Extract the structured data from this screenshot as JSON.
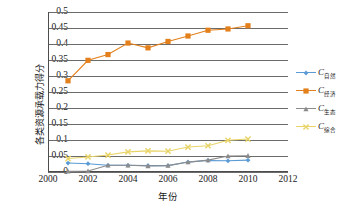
{
  "chart_data": {
    "type": "line",
    "title": "",
    "xlabel": "年份",
    "ylabel": "各类资源承载力得分",
    "xlim": [
      2000,
      2012
    ],
    "ylim": [
      0,
      0.5
    ],
    "grid": "horizontal",
    "legend_position": "right",
    "x": [
      2001,
      2002,
      2003,
      2004,
      2005,
      2006,
      2007,
      2008,
      2009,
      2010
    ],
    "xticks": [
      "2000",
      "2002",
      "2004",
      "2006",
      "2008",
      "2010",
      "2012"
    ],
    "xtick_values": [
      2000,
      2002,
      2004,
      2006,
      2008,
      2010,
      2012
    ],
    "yticks": [
      "0",
      "0.05",
      "0.1",
      "0.15",
      "0.2",
      "0.25",
      "0.3",
      "0.35",
      "0.4",
      "0.45",
      "0.5"
    ],
    "ytick_values": [
      0,
      0.05,
      0.1,
      0.15,
      0.2,
      0.25,
      0.3,
      0.35,
      0.4,
      0.45,
      0.5
    ],
    "series": [
      {
        "name": "C自然",
        "name_base": "C",
        "name_sub": "自然",
        "color": "#5B9BD5",
        "marker": "diamond",
        "values": [
          0.028,
          0.026,
          0.021,
          0.021,
          0.02,
          0.02,
          0.031,
          0.036,
          0.035,
          0.037
        ]
      },
      {
        "name": "C经济",
        "name_base": "C",
        "name_sub": "经济",
        "color": "#E3801B",
        "marker": "square",
        "values": [
          0.285,
          0.349,
          0.367,
          0.403,
          0.388,
          0.408,
          0.425,
          0.443,
          0.447,
          0.457
        ]
      },
      {
        "name": "C生态",
        "name_base": "C",
        "name_sub": "生态",
        "color": "#8C8C8C",
        "marker": "triangle",
        "values": [
          0.002,
          0.003,
          0.021,
          0.021,
          0.019,
          0.02,
          0.031,
          0.037,
          0.05,
          0.051
        ]
      },
      {
        "name": "C综合",
        "name_base": "C",
        "name_sub": "综合",
        "color": "#E8D468",
        "marker": "cross",
        "values": [
          0.042,
          0.047,
          0.053,
          0.063,
          0.066,
          0.065,
          0.078,
          0.082,
          0.099,
          0.103
        ]
      }
    ]
  }
}
